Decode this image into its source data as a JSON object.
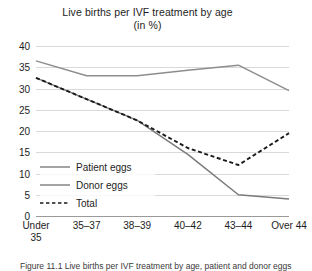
{
  "chart_data": {
    "type": "line",
    "title": "Live births per IVF treatment by age",
    "subtitle": "(in %)",
    "xlabel": "",
    "ylabel": "",
    "categories": [
      "Under 35",
      "35–37",
      "38–39",
      "40–42",
      "43–44",
      "Over 44"
    ],
    "ylim": [
      0,
      40
    ],
    "yticks": [
      0,
      5,
      10,
      15,
      20,
      25,
      30,
      35,
      40
    ],
    "grid": "horizontal",
    "legend_position": "inside-lower-left",
    "series": [
      {
        "name": "Patient eggs",
        "values": [
          32.5,
          27.5,
          22.5,
          14.5,
          5.0,
          4.0
        ],
        "style": "solid",
        "color": "#7a7a7a"
      },
      {
        "name": "Donor eggs",
        "values": [
          36.5,
          33.0,
          33.0,
          34.3,
          35.5,
          29.5
        ],
        "style": "solid",
        "color": "#8d8d8d"
      },
      {
        "name": "Total",
        "values": [
          32.5,
          27.5,
          22.5,
          16.0,
          12.0,
          19.5
        ],
        "style": "dashed",
        "color": "#1a1a1a"
      }
    ]
  },
  "axis": {
    "ytick_labels": [
      "40",
      "35",
      "30",
      "25",
      "20",
      "15",
      "10",
      "5",
      "0"
    ],
    "xtick_labels": [
      "Under\n35",
      "35–37",
      "38–39",
      "40–42",
      "43–44",
      "Over 44"
    ]
  },
  "legend": {
    "items": [
      {
        "label": "Patient eggs"
      },
      {
        "label": "Donor eggs"
      },
      {
        "label": "Total"
      }
    ]
  },
  "caption": {
    "text": "Figure 11.1 Live births per IVF treatment by age, patient and donor eggs"
  },
  "colors": {
    "gridline": "#d9d9d9",
    "axis": "#9a9a9a",
    "text": "#1d1d1d",
    "patient_eggs": "#7a7a7a",
    "donor_eggs": "#8d8d8d",
    "total": "#1a1a1a"
  }
}
